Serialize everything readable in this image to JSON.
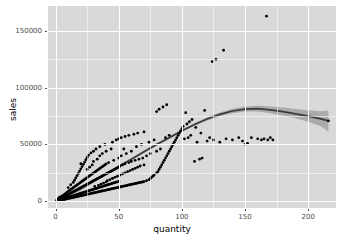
{
  "chart_data": {
    "type": "scatter",
    "title": "",
    "subtitle": "",
    "xlabel": "quantity",
    "ylabel": "sales",
    "xlim": [
      -6,
      222
    ],
    "ylim": [
      -6000,
      172000
    ],
    "xticks": [
      0,
      50,
      100,
      150,
      200
    ],
    "xticklabels": [
      "0",
      "50",
      "100",
      "150",
      "200"
    ],
    "yticks": [
      0,
      50000,
      100000,
      150000
    ],
    "yticklabels": [
      "0",
      "50000",
      "100000",
      "150000"
    ],
    "xminor": [
      25,
      75,
      125,
      175,
      200
    ],
    "yminor": [
      25000,
      75000,
      125000
    ],
    "grid": true,
    "legend": "none",
    "panel_color": "#d9d9d9",
    "grid_color": "#ffffff",
    "point_color": "#000000",
    "point_size": 2.1,
    "smooth_line_color": "#3b3b3b",
    "smooth_band_color": "#9a9a9a",
    "smooth": {
      "method": "loess",
      "x": [
        2,
        10,
        20,
        30,
        40,
        50,
        60,
        70,
        80,
        90,
        100,
        110,
        120,
        130,
        140,
        150,
        160,
        170,
        180,
        190,
        200,
        210,
        216
      ],
      "y": [
        1500,
        5500,
        11000,
        17500,
        24000,
        30500,
        37000,
        43500,
        50000,
        56000,
        62000,
        67500,
        72500,
        76500,
        79500,
        81200,
        81500,
        80500,
        79000,
        77000,
        75000,
        72500,
        70800
      ],
      "ymin": [
        600,
        4200,
        9600,
        16200,
        22800,
        29400,
        35900,
        42400,
        48900,
        54900,
        60900,
        66400,
        71200,
        74900,
        77600,
        79000,
        79000,
        77600,
        75600,
        73000,
        70000,
        66000,
        61500
      ],
      "ymax": [
        2600,
        6900,
        12500,
        18900,
        25300,
        31700,
        38200,
        44700,
        51200,
        57200,
        63200,
        68700,
        73900,
        78200,
        81500,
        83500,
        84100,
        83500,
        82500,
        81200,
        80200,
        79200,
        79800
      ]
    },
    "points": [
      [
        1,
        400
      ],
      [
        1,
        900
      ],
      [
        2,
        1200
      ],
      [
        2,
        2100
      ],
      [
        2,
        600
      ],
      [
        3,
        1500
      ],
      [
        3,
        2600
      ],
      [
        3,
        900
      ],
      [
        3,
        3400
      ],
      [
        4,
        1100
      ],
      [
        4,
        2300
      ],
      [
        4,
        3800
      ],
      [
        4,
        700
      ],
      [
        5,
        1600
      ],
      [
        5,
        2900
      ],
      [
        5,
        4500
      ],
      [
        5,
        1000
      ],
      [
        6,
        2000
      ],
      [
        6,
        3500
      ],
      [
        6,
        5200
      ],
      [
        6,
        1300
      ],
      [
        7,
        2400
      ],
      [
        7,
        4100
      ],
      [
        7,
        6000
      ],
      [
        7,
        1500
      ],
      [
        8,
        2800
      ],
      [
        8,
        4800
      ],
      [
        8,
        6900
      ],
      [
        8,
        1800
      ],
      [
        9,
        3100
      ],
      [
        9,
        5400
      ],
      [
        9,
        7700
      ],
      [
        9,
        2000
      ],
      [
        10,
        3500
      ],
      [
        10,
        6000
      ],
      [
        10,
        8600
      ],
      [
        10,
        2300
      ],
      [
        10,
        12000
      ],
      [
        11,
        3800
      ],
      [
        11,
        6600
      ],
      [
        11,
        9400
      ],
      [
        11,
        2500
      ],
      [
        12,
        4200
      ],
      [
        12,
        7200
      ],
      [
        12,
        10200
      ],
      [
        12,
        2800
      ],
      [
        12,
        14500
      ],
      [
        13,
        4500
      ],
      [
        13,
        7800
      ],
      [
        13,
        11000
      ],
      [
        13,
        3000
      ],
      [
        14,
        4900
      ],
      [
        14,
        8400
      ],
      [
        14,
        11900
      ],
      [
        14,
        3300
      ],
      [
        14,
        16500
      ],
      [
        15,
        5200
      ],
      [
        15,
        9000
      ],
      [
        15,
        12700
      ],
      [
        15,
        3500
      ],
      [
        15,
        18500
      ],
      [
        16,
        5600
      ],
      [
        16,
        9600
      ],
      [
        16,
        13500
      ],
      [
        16,
        3800
      ],
      [
        16,
        20500
      ],
      [
        17,
        5900
      ],
      [
        17,
        10200
      ],
      [
        17,
        14300
      ],
      [
        17,
        4000
      ],
      [
        17,
        22500
      ],
      [
        18,
        6300
      ],
      [
        18,
        10800
      ],
      [
        18,
        15100
      ],
      [
        18,
        4300
      ],
      [
        18,
        24500
      ],
      [
        19,
        6600
      ],
      [
        19,
        11400
      ],
      [
        19,
        16000
      ],
      [
        19,
        4500
      ],
      [
        19,
        26500
      ],
      [
        20,
        7000
      ],
      [
        20,
        12000
      ],
      [
        20,
        16800
      ],
      [
        20,
        4800
      ],
      [
        20,
        28500
      ],
      [
        20,
        33000
      ],
      [
        21,
        7300
      ],
      [
        21,
        12600
      ],
      [
        21,
        17600
      ],
      [
        21,
        5000
      ],
      [
        21,
        30500
      ],
      [
        22,
        7700
      ],
      [
        22,
        13200
      ],
      [
        22,
        18400
      ],
      [
        22,
        5300
      ],
      [
        22,
        32500
      ],
      [
        23,
        8000
      ],
      [
        23,
        13800
      ],
      [
        23,
        19200
      ],
      [
        23,
        5500
      ],
      [
        23,
        34500
      ],
      [
        24,
        8400
      ],
      [
        24,
        14400
      ],
      [
        24,
        20000
      ],
      [
        24,
        5800
      ],
      [
        24,
        36500
      ],
      [
        25,
        8700
      ],
      [
        25,
        15000
      ],
      [
        25,
        20800
      ],
      [
        25,
        6000
      ],
      [
        25,
        38500
      ],
      [
        25,
        28000
      ],
      [
        26,
        9100
      ],
      [
        26,
        15600
      ],
      [
        26,
        21600
      ],
      [
        26,
        6300
      ],
      [
        26,
        40500
      ],
      [
        27,
        9400
      ],
      [
        27,
        16200
      ],
      [
        27,
        22400
      ],
      [
        27,
        6500
      ],
      [
        27,
        30000
      ],
      [
        28,
        9800
      ],
      [
        28,
        16800
      ],
      [
        28,
        23200
      ],
      [
        28,
        6800
      ],
      [
        28,
        42500
      ],
      [
        29,
        10100
      ],
      [
        29,
        17400
      ],
      [
        29,
        24000
      ],
      [
        29,
        7000
      ],
      [
        29,
        32000
      ],
      [
        30,
        10500
      ],
      [
        30,
        18000
      ],
      [
        30,
        24800
      ],
      [
        30,
        7300
      ],
      [
        30,
        44000
      ],
      [
        30,
        35000
      ],
      [
        31,
        10800
      ],
      [
        31,
        18600
      ],
      [
        31,
        25600
      ],
      [
        31,
        7500
      ],
      [
        31,
        13000
      ],
      [
        32,
        11200
      ],
      [
        32,
        19200
      ],
      [
        32,
        26400
      ],
      [
        32,
        7800
      ],
      [
        32,
        46000
      ],
      [
        33,
        11500
      ],
      [
        33,
        19800
      ],
      [
        33,
        27200
      ],
      [
        33,
        8000
      ],
      [
        33,
        37000
      ],
      [
        34,
        11900
      ],
      [
        34,
        20400
      ],
      [
        34,
        28000
      ],
      [
        34,
        8300
      ],
      [
        34,
        14000
      ],
      [
        35,
        12200
      ],
      [
        35,
        21000
      ],
      [
        35,
        28800
      ],
      [
        35,
        8500
      ],
      [
        35,
        48000
      ],
      [
        35,
        40000
      ],
      [
        36,
        12600
      ],
      [
        36,
        21600
      ],
      [
        36,
        29600
      ],
      [
        36,
        8800
      ],
      [
        36,
        15000
      ],
      [
        37,
        12900
      ],
      [
        37,
        22200
      ],
      [
        37,
        30400
      ],
      [
        37,
        9000
      ],
      [
        37,
        42000
      ],
      [
        38,
        13300
      ],
      [
        38,
        22800
      ],
      [
        38,
        31200
      ],
      [
        38,
        9300
      ],
      [
        38,
        16000
      ],
      [
        39,
        13600
      ],
      [
        39,
        23400
      ],
      [
        39,
        32000
      ],
      [
        39,
        9500
      ],
      [
        39,
        50000
      ],
      [
        40,
        14000
      ],
      [
        40,
        24000
      ],
      [
        40,
        32800
      ],
      [
        40,
        9800
      ],
      [
        40,
        17000
      ],
      [
        40,
        44000
      ],
      [
        41,
        14300
      ],
      [
        41,
        24600
      ],
      [
        41,
        10000
      ],
      [
        41,
        18000
      ],
      [
        42,
        14700
      ],
      [
        42,
        25200
      ],
      [
        42,
        10300
      ],
      [
        42,
        34000
      ],
      [
        43,
        15000
      ],
      [
        43,
        25800
      ],
      [
        43,
        10500
      ],
      [
        43,
        19000
      ],
      [
        44,
        15400
      ],
      [
        44,
        26400
      ],
      [
        44,
        10800
      ],
      [
        44,
        46000
      ],
      [
        45,
        15700
      ],
      [
        45,
        27000
      ],
      [
        45,
        11000
      ],
      [
        45,
        20000
      ],
      [
        45,
        52000
      ],
      [
        46,
        16100
      ],
      [
        46,
        27600
      ],
      [
        46,
        11300
      ],
      [
        46,
        36000
      ],
      [
        47,
        16400
      ],
      [
        47,
        28200
      ],
      [
        47,
        11500
      ],
      [
        47,
        21000
      ],
      [
        48,
        16800
      ],
      [
        48,
        28800
      ],
      [
        48,
        11800
      ],
      [
        48,
        54000
      ],
      [
        49,
        17100
      ],
      [
        49,
        29400
      ],
      [
        49,
        12000
      ],
      [
        49,
        22000
      ],
      [
        50,
        17500
      ],
      [
        50,
        30000
      ],
      [
        50,
        12300
      ],
      [
        50,
        38000
      ],
      [
        50,
        55000
      ],
      [
        51,
        12500
      ],
      [
        51,
        23000
      ],
      [
        51,
        31000
      ],
      [
        52,
        12800
      ],
      [
        52,
        56000
      ],
      [
        52,
        40000
      ],
      [
        53,
        13000
      ],
      [
        53,
        24000
      ],
      [
        53,
        32000
      ],
      [
        54,
        13300
      ],
      [
        54,
        46000
      ],
      [
        55,
        13500
      ],
      [
        55,
        25000
      ],
      [
        55,
        57000
      ],
      [
        55,
        33000
      ],
      [
        56,
        13800
      ],
      [
        56,
        42000
      ],
      [
        57,
        14000
      ],
      [
        57,
        26000
      ],
      [
        58,
        14300
      ],
      [
        58,
        34000
      ],
      [
        58,
        58000
      ],
      [
        59,
        14500
      ],
      [
        59,
        27000
      ],
      [
        60,
        14800
      ],
      [
        60,
        44000
      ],
      [
        60,
        35000
      ],
      [
        61,
        15000
      ],
      [
        61,
        28000
      ],
      [
        62,
        15300
      ],
      [
        62,
        59000
      ],
      [
        63,
        15500
      ],
      [
        63,
        29000
      ],
      [
        63,
        36000
      ],
      [
        64,
        15800
      ],
      [
        64,
        48000
      ],
      [
        65,
        16000
      ],
      [
        65,
        30000
      ],
      [
        65,
        60000
      ],
      [
        66,
        16300
      ],
      [
        66,
        37000
      ],
      [
        67,
        16500
      ],
      [
        67,
        31000
      ],
      [
        68,
        16800
      ],
      [
        68,
        50000
      ],
      [
        69,
        17000
      ],
      [
        69,
        38000
      ],
      [
        70,
        17300
      ],
      [
        70,
        32000
      ],
      [
        70,
        61000
      ],
      [
        72,
        18000
      ],
      [
        72,
        40000
      ],
      [
        74,
        19000
      ],
      [
        74,
        52000
      ],
      [
        75,
        20000
      ],
      [
        75,
        42000
      ],
      [
        76,
        21000
      ],
      [
        77,
        22000
      ],
      [
        78,
        23000
      ],
      [
        78,
        54000
      ],
      [
        80,
        25000
      ],
      [
        80,
        44000
      ],
      [
        80,
        79000
      ],
      [
        81,
        26000
      ],
      [
        82,
        28000
      ],
      [
        82,
        81000
      ],
      [
        83,
        30000
      ],
      [
        83,
        46000
      ],
      [
        84,
        32000
      ],
      [
        85,
        34000
      ],
      [
        85,
        83000
      ],
      [
        86,
        36000
      ],
      [
        87,
        38000
      ],
      [
        87,
        56000
      ],
      [
        88,
        40000
      ],
      [
        88,
        85000
      ],
      [
        89,
        42000
      ],
      [
        90,
        44000
      ],
      [
        90,
        58000
      ],
      [
        91,
        46000
      ],
      [
        92,
        48000
      ],
      [
        93,
        50000
      ],
      [
        94,
        52000
      ],
      [
        95,
        54000
      ],
      [
        96,
        56000
      ],
      [
        97,
        58000
      ],
      [
        98,
        60000
      ],
      [
        99,
        62000
      ],
      [
        100,
        64000
      ],
      [
        101,
        66000
      ],
      [
        102,
        55000
      ],
      [
        103,
        78000
      ],
      [
        104,
        68000
      ],
      [
        105,
        56000
      ],
      [
        106,
        70000
      ],
      [
        107,
        58000
      ],
      [
        108,
        72000
      ],
      [
        110,
        35000
      ],
      [
        111,
        65000
      ],
      [
        112,
        52000
      ],
      [
        114,
        37000
      ],
      [
        115,
        60000
      ],
      [
        116,
        38000
      ],
      [
        118,
        80000
      ],
      [
        120,
        53000
      ],
      [
        122,
        56000
      ],
      [
        124,
        123000
      ],
      [
        125,
        54000
      ],
      [
        127,
        125000
      ],
      [
        130,
        52000
      ],
      [
        133,
        133000
      ],
      [
        135,
        55000
      ],
      [
        140,
        54000
      ],
      [
        145,
        56000
      ],
      [
        148,
        53000
      ],
      [
        150,
        50000
      ],
      [
        152,
        51000
      ],
      [
        155,
        56000
      ],
      [
        160,
        55000
      ],
      [
        163,
        54000
      ],
      [
        165,
        55000
      ],
      [
        167,
        163000
      ],
      [
        168,
        54000
      ],
      [
        170,
        56000
      ],
      [
        172,
        54000
      ],
      [
        216,
        70800
      ]
    ]
  }
}
